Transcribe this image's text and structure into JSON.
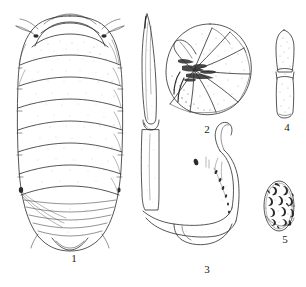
{
  "plate": {
    "kind": "scientific-line-drawing-plate",
    "background_color": "#ffffff",
    "ink_color": "#2b2b2b",
    "panel_count": 5,
    "figures": [
      {
        "number": "1",
        "name": "dorsal-habitus",
        "description": "Dorsal view of entire pill bug body showing cephalon, seven pereonites and pleon with telson",
        "segment_count": 7,
        "label_x": 74,
        "label_y": 259
      },
      {
        "number": "2",
        "name": "conglobated-body",
        "description": "Animal rolled into a ball (conglobation), radiating tergite plates",
        "label_x": 200,
        "label_y": 126
      },
      {
        "number": "3",
        "name": "appendage-pleopod",
        "description": "Elongate appendage with bent basal article and setose margin",
        "label_x": 201,
        "label_y": 266
      },
      {
        "number": "4",
        "name": "antenna-tip",
        "description": "Distal two articles of antenna, stippled",
        "label_x": 281,
        "label_y": 124
      },
      {
        "number": "5",
        "name": "oval-granular-structure",
        "description": "Oval outline filled with dark crescent-shaped granules",
        "granule_count": 16,
        "label_x": 279,
        "label_y": 236
      }
    ]
  },
  "labels": {
    "fig1": "1",
    "fig2": "2",
    "fig3": "3",
    "fig4": "4",
    "fig5": "5"
  }
}
